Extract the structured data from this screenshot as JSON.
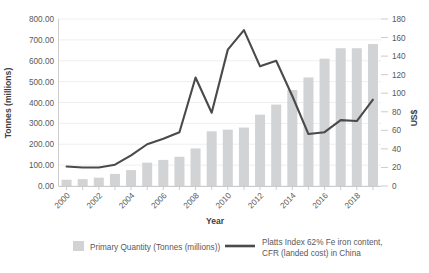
{
  "chart_data": {
    "type": "bar",
    "title": "",
    "xlabel": "Year",
    "ylabel": "Tonnes (millions)",
    "y2label": "US$",
    "grid": true,
    "legend_position": "bottom",
    "categories": [
      "2000",
      "2001",
      "2002",
      "2003",
      "2004",
      "2005",
      "2006",
      "2007",
      "2008",
      "2009",
      "2010",
      "2011",
      "2012",
      "2013",
      "2014",
      "2015",
      "2016",
      "2017",
      "2018",
      "2019"
    ],
    "xtick_labels": [
      "2000",
      "2002",
      "2004",
      "2006",
      "2008",
      "2010",
      "2012",
      "2014",
      "2016",
      "2018"
    ],
    "ylim": [
      0,
      800
    ],
    "yticks": [
      "0.00",
      "100.00",
      "200.00",
      "300.00",
      "400.00",
      "500.00",
      "600.00",
      "700.00",
      "800.00"
    ],
    "y2lim": [
      0,
      180
    ],
    "y2ticks": [
      "0",
      "20",
      "40",
      "60",
      "80",
      "100",
      "120",
      "140",
      "160",
      "180"
    ],
    "series": [
      {
        "name": "Primary Quantity (Tonnes (millions))",
        "type": "bar",
        "axis": "left",
        "color": "#d2d3d5",
        "values": [
          30,
          33,
          40,
          58,
          76,
          112,
          125,
          140,
          180,
          262,
          270,
          280,
          342,
          390,
          460,
          520,
          610,
          660,
          660,
          680
        ]
      },
      {
        "name": "Platts Index 62% Fe iron content, CFR (landed cost) in China",
        "type": "line",
        "axis": "right",
        "color": "#4a4a4a",
        "values": [
          21,
          20,
          20,
          23,
          33,
          45,
          51,
          58,
          117,
          79,
          147,
          168,
          129,
          135,
          97,
          56,
          58,
          71,
          70,
          93
        ]
      }
    ]
  },
  "legend": {
    "items": [
      {
        "label": "Primary Quantity (Tonnes (millions))",
        "marker": "swatch",
        "color": "#d2d3d5"
      },
      {
        "label": "Platts Index 62% Fe iron content,",
        "label2": "CFR (landed cost) in China",
        "marker": "line",
        "color": "#4a4a4a"
      }
    ]
  }
}
